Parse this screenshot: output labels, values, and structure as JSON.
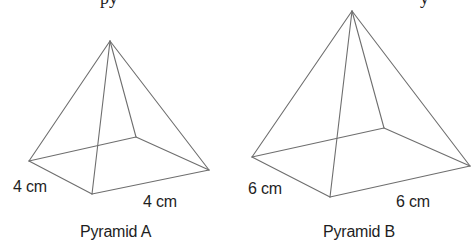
{
  "cropped_text": {
    "left_fragment": "py",
    "right_fragment": "y"
  },
  "pyramids": [
    {
      "name": "Pyramid A",
      "caption": "Pyramid A",
      "side_label_left": "4 cm",
      "side_label_right": "4 cm",
      "vertices": {
        "apex": [
          110,
          41
        ],
        "left": [
          29,
          161
        ],
        "front": [
          92,
          194
        ],
        "right": [
          209,
          170
        ],
        "back": [
          136,
          137
        ]
      }
    },
    {
      "name": "Pyramid B",
      "caption": "Pyramid B",
      "side_label_left": "6 cm",
      "side_label_right": "6 cm",
      "vertices": {
        "apex": [
          352,
          11
        ],
        "left": [
          252,
          157
        ],
        "front": [
          330,
          197
        ],
        "right": [
          470,
          166
        ],
        "back": [
          384,
          128
        ]
      }
    }
  ]
}
